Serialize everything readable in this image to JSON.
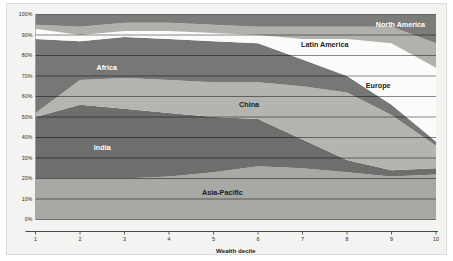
{
  "chart_data": {
    "type": "area",
    "stacked": true,
    "normalized_percent": true,
    "title": "",
    "subtitle": "",
    "xlabel": "Wealth decile",
    "ylabel": "",
    "xlim": [
      1,
      10
    ],
    "ylim": [
      0,
      100
    ],
    "grid": true,
    "legend_position": "inline-labels",
    "x": [
      1,
      2,
      3,
      4,
      5,
      6,
      7,
      8,
      9,
      10
    ],
    "xtick_labels": [
      "1",
      "2",
      "3",
      "4",
      "5",
      "6",
      "7",
      "8",
      "9",
      "10"
    ],
    "ytick_labels": [
      "0%",
      "10%",
      "20%",
      "30%",
      "40%",
      "50%",
      "60%",
      "70%",
      "80%",
      "90%",
      "100%"
    ],
    "ytick_values": [
      0,
      10,
      20,
      30,
      40,
      50,
      60,
      70,
      80,
      90,
      100
    ],
    "series": [
      {
        "name": "Asia-Pacific",
        "color": "#a8a8a5",
        "label_color": "dark",
        "label_x": 5.2,
        "label_y": 12,
        "values": [
          20,
          20,
          20,
          21,
          23,
          26,
          25,
          23,
          21,
          22
        ]
      },
      {
        "name": "India",
        "color": "#6e6e6d",
        "label_color": "light",
        "label_x": 2.5,
        "label_y": 34,
        "values": [
          30,
          36,
          34,
          31,
          27,
          23,
          14,
          6,
          3,
          3
        ]
      },
      {
        "name": "China",
        "color": "#b4b4b1",
        "label_color": "dark",
        "label_x": 5.8,
        "label_y": 55,
        "values": [
          2,
          12,
          15,
          16,
          17,
          18,
          26,
          33,
          27,
          11
        ]
      },
      {
        "name": "Africa",
        "color": "#777776",
        "label_color": "light",
        "label_x": 2.6,
        "label_y": 73,
        "values": [
          36,
          19,
          20,
          20,
          20,
          19,
          13,
          8,
          5,
          2
        ]
      },
      {
        "name": "Europe",
        "color": "#fbfbfa",
        "label_color": "dark",
        "label_x": 8.7,
        "label_y": 64,
        "values": [
          5,
          3,
          3,
          4,
          4,
          4,
          10,
          18,
          30,
          36
        ]
      },
      {
        "name": "Latin America",
        "color": "#b0b0ad",
        "label_color": "dark",
        "label_x": 7.5,
        "label_y": 84,
        "values": [
          2,
          4,
          4,
          4,
          4,
          4,
          6,
          6,
          8,
          12
        ]
      },
      {
        "name": "North America",
        "color": "#7c7c7b",
        "label_color": "light",
        "label_x": 9.2,
        "label_y": 94,
        "values": [
          5,
          6,
          4,
          4,
          5,
          6,
          6,
          6,
          6,
          14
        ]
      }
    ]
  },
  "axes": {
    "x_axis_title": "Wealth decile"
  }
}
